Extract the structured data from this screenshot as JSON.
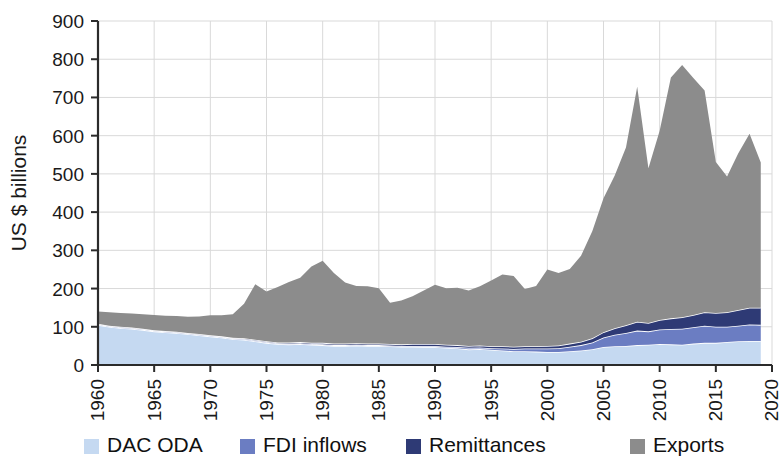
{
  "chart_data": {
    "type": "area",
    "stacked": true,
    "title": "",
    "subtitle": "",
    "xlabel": "",
    "ylabel": "US $ billions",
    "ylim": [
      0,
      900
    ],
    "xlim": [
      1960,
      2020
    ],
    "ytick_labels": [
      "0",
      "100",
      "200",
      "300",
      "400",
      "500",
      "600",
      "700",
      "800",
      "900"
    ],
    "ytick_values": [
      0,
      100,
      200,
      300,
      400,
      500,
      600,
      700,
      800,
      900
    ],
    "xtick_labels": [
      "1960",
      "1965",
      "1970",
      "1975",
      "1980",
      "1985",
      "1990",
      "1995",
      "2000",
      "2005",
      "2010",
      "2015",
      "2020"
    ],
    "xtick_values": [
      1960,
      1965,
      1970,
      1975,
      1980,
      1985,
      1990,
      1995,
      2000,
      2005,
      2010,
      2015,
      2020
    ],
    "grid": true,
    "grid_axes": "both",
    "legend_position": "bottom",
    "x": [
      1960,
      1961,
      1962,
      1963,
      1964,
      1965,
      1966,
      1967,
      1968,
      1969,
      1970,
      1971,
      1972,
      1973,
      1974,
      1975,
      1976,
      1977,
      1978,
      1979,
      1980,
      1981,
      1982,
      1983,
      1984,
      1985,
      1986,
      1987,
      1988,
      1989,
      1990,
      1991,
      1992,
      1993,
      1994,
      1995,
      1996,
      1997,
      1998,
      1999,
      2000,
      2001,
      2002,
      2003,
      2004,
      2005,
      2006,
      2007,
      2008,
      2009,
      2010,
      2011,
      2012,
      2013,
      2014,
      2015,
      2016,
      2017,
      2018,
      2019
    ],
    "series": [
      {
        "name": "DAC ODA",
        "color": "#c5d9f1",
        "values": [
          105,
          100,
          97,
          95,
          92,
          88,
          86,
          84,
          81,
          78,
          75,
          72,
          68,
          66,
          62,
          58,
          55,
          54,
          55,
          53,
          52,
          50,
          50,
          51,
          50,
          50,
          49,
          48,
          48,
          47,
          47,
          45,
          44,
          41,
          42,
          40,
          38,
          36,
          36,
          35,
          34,
          34,
          36,
          38,
          41,
          47,
          49,
          50,
          52,
          53,
          55,
          54,
          53,
          56,
          58,
          58,
          60,
          62,
          63,
          63
        ]
      },
      {
        "name": "FDI inflows",
        "color": "#6b7dc2",
        "values": [
          2,
          2,
          2,
          2,
          2,
          2,
          2,
          2,
          2,
          2,
          2,
          2,
          2,
          2,
          2,
          2,
          2,
          2,
          2,
          2,
          2,
          2,
          2,
          2,
          2,
          2,
          2,
          2,
          2,
          3,
          3,
          3,
          3,
          4,
          4,
          4,
          5,
          6,
          7,
          8,
          9,
          10,
          12,
          14,
          18,
          25,
          30,
          34,
          38,
          35,
          38,
          40,
          42,
          43,
          45,
          42,
          40,
          41,
          43,
          42
        ]
      },
      {
        "name": "Remittances",
        "color": "#2e3a75",
        "values": [
          1,
          1,
          1,
          1,
          1,
          1,
          1,
          1,
          1,
          1,
          1,
          1,
          1,
          2,
          2,
          2,
          2,
          3,
          3,
          3,
          4,
          4,
          4,
          4,
          4,
          4,
          4,
          4,
          5,
          5,
          5,
          5,
          5,
          5,
          5,
          5,
          6,
          6,
          6,
          6,
          7,
          7,
          8,
          9,
          11,
          14,
          17,
          20,
          23,
          22,
          25,
          28,
          30,
          32,
          35,
          36,
          38,
          41,
          44,
          45
        ]
      },
      {
        "name": "Exports",
        "color": "#8c8c8c",
        "values": [
          32,
          35,
          36,
          37,
          38,
          40,
          40,
          41,
          42,
          46,
          52,
          55,
          62,
          90,
          145,
          130,
          145,
          158,
          168,
          200,
          215,
          185,
          160,
          150,
          150,
          145,
          108,
          115,
          125,
          140,
          155,
          148,
          150,
          145,
          155,
          172,
          188,
          185,
          150,
          158,
          200,
          190,
          195,
          225,
          280,
          350,
          400,
          465,
          615,
          405,
          495,
          630,
          660,
          620,
          580,
          395,
          355,
          410,
          455,
          380
        ]
      }
    ]
  },
  "legend": {
    "items": [
      {
        "label": "DAC ODA",
        "color": "#c5d9f1"
      },
      {
        "label": "FDI inflows",
        "color": "#6b7dc2"
      },
      {
        "label": "Remittances",
        "color": "#2e3a75"
      },
      {
        "label": "Exports",
        "color": "#8c8c8c"
      }
    ]
  },
  "axis": {
    "y_title": "US $ billions"
  }
}
